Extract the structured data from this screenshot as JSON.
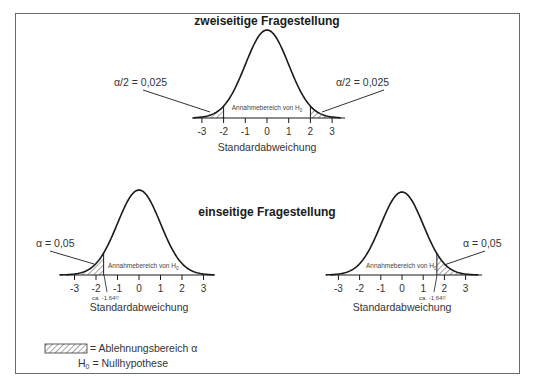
{
  "diagrams": {
    "two_sided": {
      "title": "zweiseitige Fragestellung",
      "alpha_left_label": "α/2 = 0,025",
      "alpha_right_label": "α/2 = 0,025",
      "acceptance_label": "Annahmebereich von H",
      "acceptance_sub": "0",
      "x_axis_label": "Standardabweichung",
      "ticks": [
        "-3",
        "-2",
        "-1",
        "0",
        "1",
        "2",
        "3"
      ],
      "critical_values": [
        -2,
        2
      ]
    },
    "one_sided_title": "einseitige Fragestellung",
    "one_sided_left": {
      "alpha_label": "α = 0,05",
      "acceptance_label": "Annahmebereich von H",
      "acceptance_sub": "0",
      "critical_label": "ca. -1,64!!",
      "x_axis_label": "Standardabweichung",
      "ticks": [
        "-3",
        "-2",
        "-1",
        "0",
        "1",
        "2",
        "3"
      ],
      "critical_value": -1.645
    },
    "one_sided_right": {
      "alpha_label": "α = 0,05",
      "acceptance_label": "Annahmebereich von H",
      "acceptance_sub": "0",
      "critical_label": "ca. -1,64!!",
      "x_axis_label": "Standardabweichung",
      "ticks": [
        "-3",
        "-2",
        "-1",
        "0",
        "1",
        "2",
        "3"
      ],
      "critical_value": 1.645
    }
  },
  "legend": {
    "rejection_label": "= Ablehnungsbereich α",
    "h0_prefix": "H",
    "h0_sub": "0",
    "h0_label": " = Nullhypothese"
  },
  "colors": {
    "border": "#6a6a6a",
    "curve": "#1a1a1a",
    "hatch": "#333333"
  }
}
